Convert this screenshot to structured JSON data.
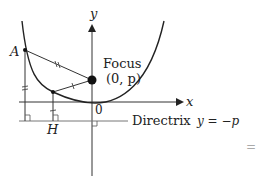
{
  "diagram": {
    "labels": {
      "y_axis": "y",
      "x_axis": "x",
      "origin": "0",
      "focus_title": "Focus",
      "focus_coords": "(0, p)",
      "point_a": "A",
      "point_h": "H",
      "directrix_word": "Directrix",
      "directrix_eq": "y = −p",
      "edge_mark": "="
    },
    "colors": {
      "stroke": "#222222",
      "light_stroke": "#777777",
      "text": "#222222"
    },
    "points": {
      "origin": [
        92,
        102
      ],
      "focus": [
        92,
        80
      ],
      "A": [
        25,
        50
      ],
      "P": [
        53,
        92
      ],
      "H": [
        53,
        121
      ]
    }
  }
}
